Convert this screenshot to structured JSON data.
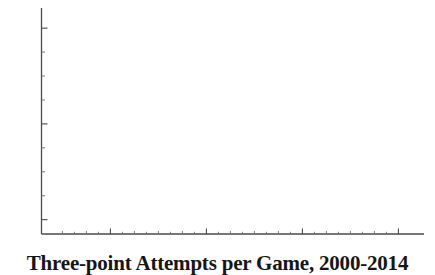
{
  "caption": {
    "text": "Three-point Attempts per Game, 2000-2014"
  },
  "axes": {
    "y_tick_labels": [
      "22",
      "18",
      "14"
    ],
    "x_tick_labels": [
      "2002",
      "2006",
      "2010",
      "2014"
    ]
  },
  "chart_data": {
    "type": "scatter",
    "title": "Three-point Attempts per Game, 2000-2014",
    "xlabel": "",
    "ylabel": "",
    "xlim": [
      1999.4,
      2014.9
    ],
    "ylim": [
      13.4,
      22.8
    ],
    "grid": false,
    "legend": null,
    "marker": "filled-square-dot",
    "marker_color": "#141414",
    "x_ticks_major": [
      2002,
      2006,
      2010,
      2014
    ],
    "y_ticks_major": [
      14,
      18,
      22
    ],
    "y_ticks_minor": [
      15,
      16,
      17,
      19,
      20,
      21
    ],
    "x": [
      2000,
      2001,
      2002,
      2003,
      2004,
      2005,
      2006,
      2007,
      2008,
      2009,
      2010,
      2011,
      2012,
      2013,
      2014
    ],
    "values": [
      13.7,
      14.7,
      14.7,
      14.9,
      15.8,
      16.0,
      16.9,
      18.1,
      18.1,
      18.1,
      18.0,
      18.4,
      20.0,
      21.5,
      22.4
    ],
    "series": [
      {
        "name": "Three-point attempts per game",
        "values": [
          13.7,
          14.7,
          14.7,
          14.9,
          15.8,
          16.0,
          16.9,
          18.1,
          18.1,
          18.1,
          18.0,
          18.4,
          20.0,
          21.5,
          22.4
        ]
      }
    ]
  }
}
